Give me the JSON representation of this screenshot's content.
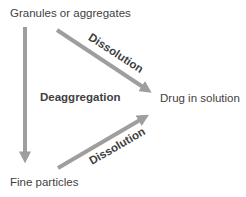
{
  "diagram": {
    "nodes": {
      "granules": "Granules or aggregates",
      "fine_particles": "Fine particles",
      "drug_in_solution": "Drug in solution"
    },
    "edges": {
      "deaggregation_label": "Deaggregation",
      "dissolution_top_label": "Dissolution",
      "dissolution_bottom_label": "Dissolution"
    },
    "colors": {
      "arrow": "#9e9e9e",
      "text": "#3f3f3f",
      "background": "#ffffff"
    }
  }
}
